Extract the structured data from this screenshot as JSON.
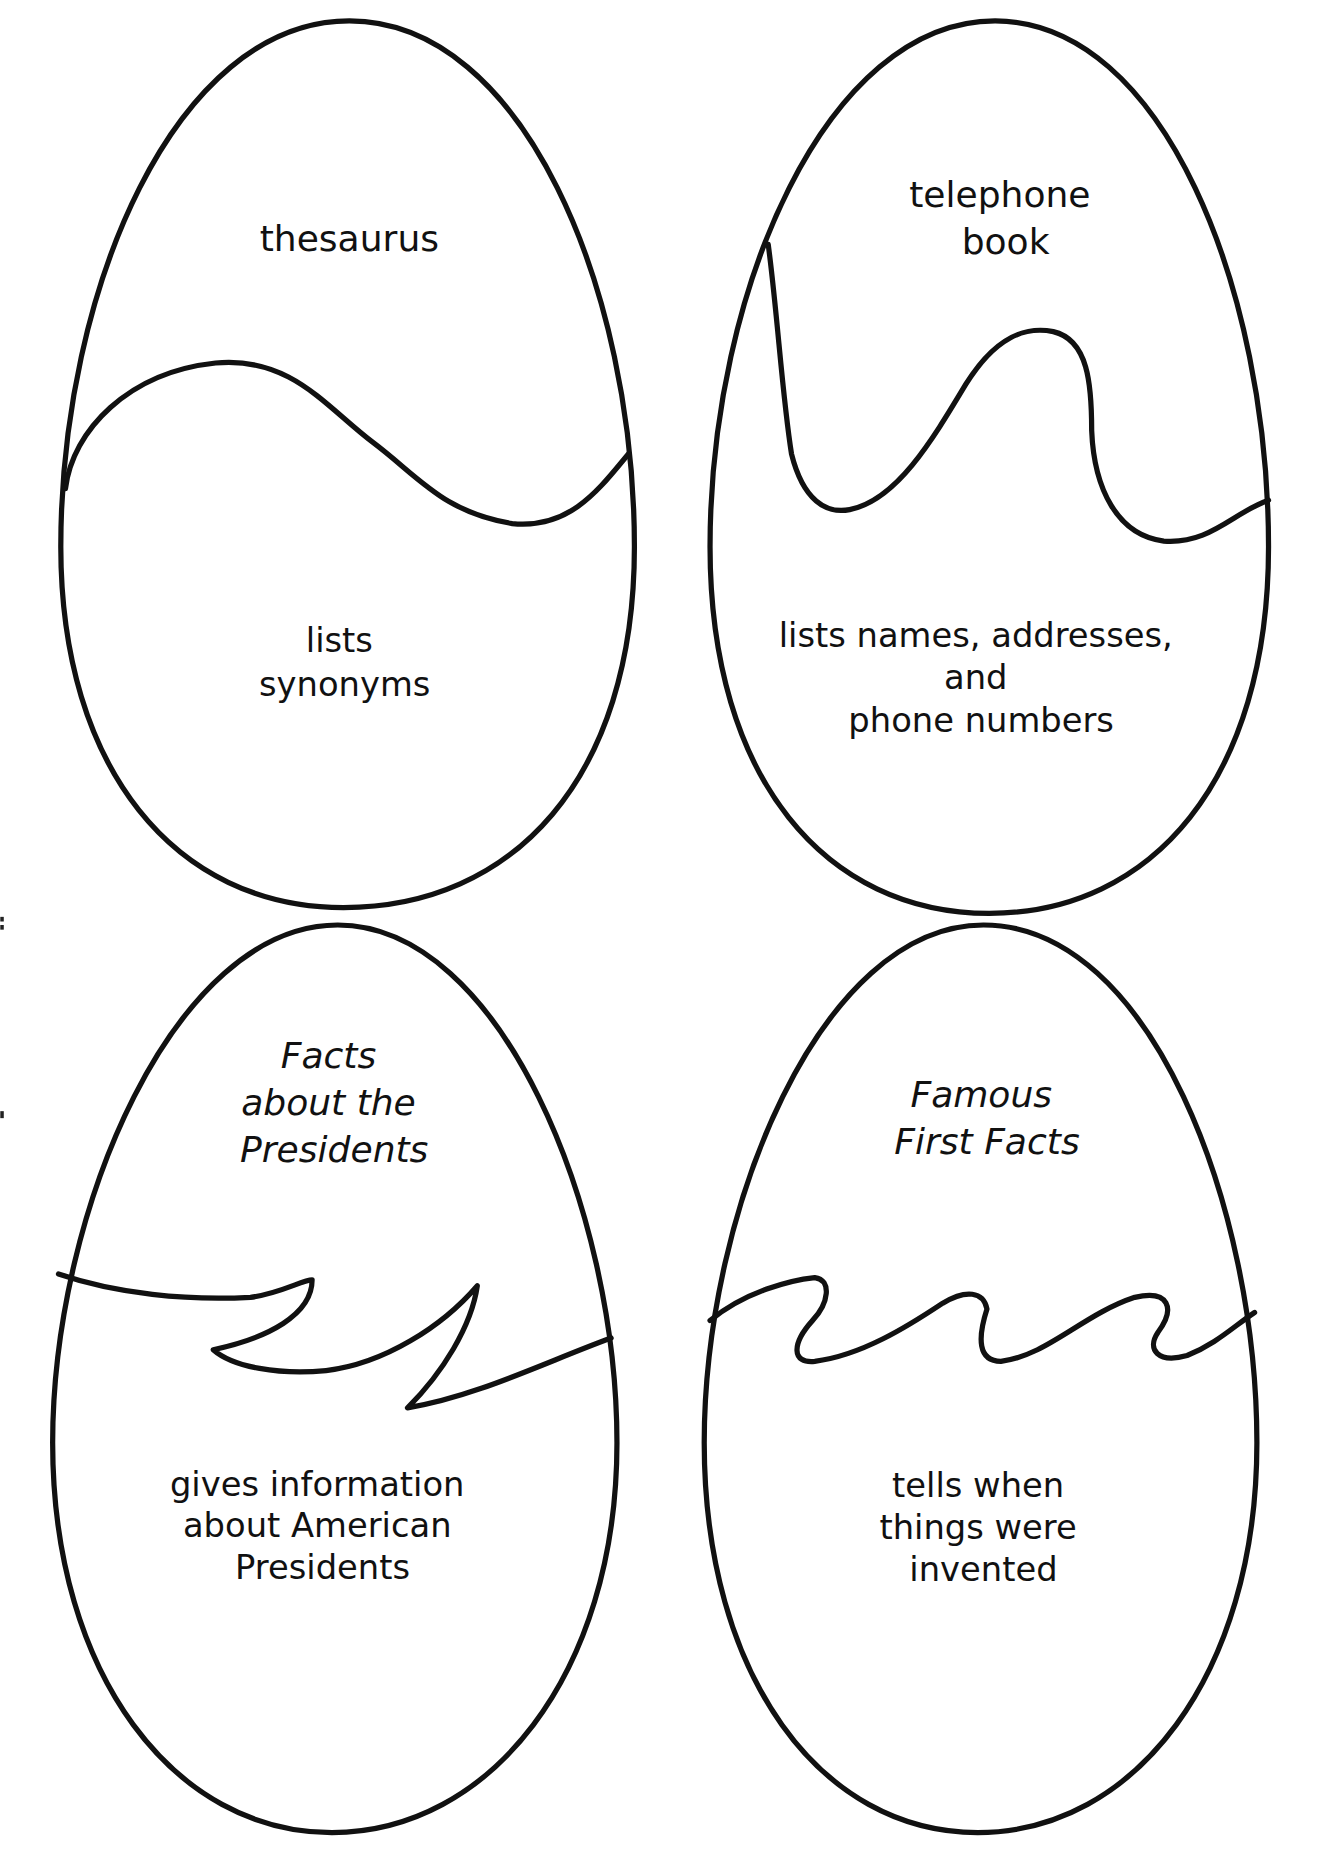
{
  "eggs": [
    {
      "id": "thesaurus",
      "top_text": [
        "thesaurus"
      ],
      "top_italic": false,
      "bottom_text": [
        "lists",
        "synonyms"
      ]
    },
    {
      "id": "telephone-book",
      "top_text": [
        "telephone",
        "book"
      ],
      "top_italic": false,
      "bottom_text": [
        "lists names, addresses,",
        "and",
        "phone numbers"
      ]
    },
    {
      "id": "facts-about-the-presidents",
      "top_text": [
        "Facts",
        "about the",
        "Presidents"
      ],
      "top_italic": true,
      "bottom_text": [
        "gives information",
        "about American",
        "Presidents"
      ]
    },
    {
      "id": "famous-first-facts",
      "top_text": [
        "Famous",
        "First Facts"
      ],
      "top_italic": true,
      "bottom_text": [
        "tells when",
        "things were",
        "invented"
      ]
    }
  ]
}
